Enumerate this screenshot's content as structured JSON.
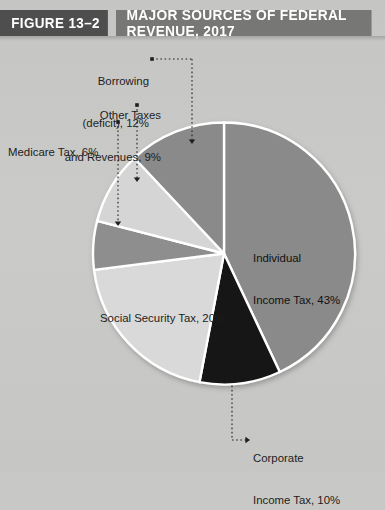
{
  "header": {
    "figure_number": "FIGURE 13–2",
    "title": "MAJOR SOURCES OF FEDERAL REVENUE, 2017",
    "figure_box_color": "#4e4e4e",
    "title_box_color": "#777775"
  },
  "background_color": "#c8c9c6",
  "chart_data": {
    "type": "pie",
    "title": "MAJOR SOURCES OF FEDERAL REVENUE, 2017",
    "xlabel": "",
    "ylabel": "",
    "units": "percent",
    "total": 100,
    "start_angle_deg": -90,
    "direction": "clockwise",
    "slice_border_color": "#ffffff",
    "categories": [
      "Individual Income Tax",
      "Corporate Income Tax",
      "Social Security Tax",
      "Medicare Tax",
      "Other Taxes and Revenues",
      "Borrowing (deficit)"
    ],
    "values": [
      43,
      10,
      20,
      6,
      9,
      12
    ],
    "colors": [
      "#8a8a8a",
      "#141414",
      "#d9d9d9",
      "#8e8e8e",
      "#d5d5d5",
      "#8a8a8a"
    ],
    "slices": [
      {
        "name": "individual-income-tax",
        "label_line1": "Individual",
        "label_line2": "Income Tax, 43%",
        "value": 43,
        "color": "#8a8a8a",
        "label_placement": "inside"
      },
      {
        "name": "corporate-income-tax",
        "label_line1": "Corporate",
        "label_line2": "Income Tax, 10%",
        "value": 10,
        "color": "#141414",
        "label_placement": "outside-bottom"
      },
      {
        "name": "social-security-tax",
        "label_line1": "Social Security Tax, 20%",
        "label_line2": "",
        "value": 20,
        "color": "#d9d9d9",
        "label_placement": "inside"
      },
      {
        "name": "medicare-tax",
        "label_line1": "Medicare Tax, 6%",
        "label_line2": "",
        "value": 6,
        "color": "#8e8e8e",
        "label_placement": "outside-left"
      },
      {
        "name": "other-taxes-and-revenues",
        "label_line1": "Other Taxes",
        "label_line2": "and Revenues, 9%",
        "value": 9,
        "color": "#d5d5d5",
        "label_placement": "outside-top-left"
      },
      {
        "name": "borrowing-deficit",
        "label_line1": "Borrowing",
        "label_line2": "(deficit), 12%",
        "value": 12,
        "color": "#8a8a8a",
        "label_placement": "outside-top"
      }
    ],
    "legend_position": "none",
    "grid": false
  }
}
